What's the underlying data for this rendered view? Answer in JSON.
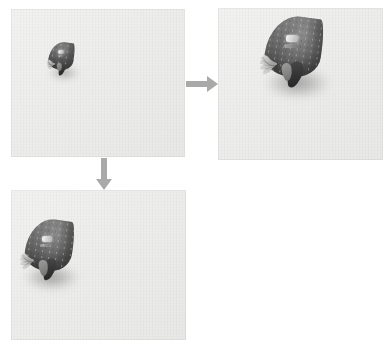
{
  "figure": {
    "kind": "image-sequence-diagram",
    "background_color": "#ffffff",
    "panel_background_color": "#ededec",
    "arrow_color": "#a9a9a9",
    "berry_body_color": "#6a6a6a",
    "berry_leaf_color": "#333333",
    "berry_sepal_color": "#b9b9b7"
  },
  "panels": [
    {
      "id": "panel-original",
      "name": "top-left-panel",
      "zoom_level": "1x",
      "x": 11,
      "y": 9,
      "width": 174,
      "height": 148,
      "subject_label": "strawberry",
      "subject": {
        "x": 36,
        "y": 32,
        "width": 31,
        "height": 35,
        "rotation": 0
      }
    },
    {
      "id": "panel-zoom-right",
      "name": "top-right-panel",
      "zoom_level": "3x",
      "x": 218,
      "y": 8,
      "width": 165,
      "height": 152,
      "subject_label": "strawberry",
      "subject": {
        "x": 43,
        "y": 6,
        "width": 68,
        "height": 76,
        "rotation": 0
      }
    },
    {
      "id": "panel-zoom-down",
      "name": "bottom-left-panel",
      "zoom_level": "2x",
      "x": 11,
      "y": 190,
      "width": 175,
      "height": 150,
      "subject_label": "strawberry",
      "subject": {
        "x": 10,
        "y": 28,
        "width": 57,
        "height": 65,
        "rotation": 0
      }
    }
  ],
  "arrows": [
    {
      "id": "arrow-right",
      "name": "arrow-right",
      "direction": "right",
      "from": "panel-original",
      "to": "panel-zoom-right",
      "x": 186,
      "y": 76,
      "length": 32,
      "thickness": 6
    },
    {
      "id": "arrow-down",
      "name": "arrow-down",
      "direction": "down",
      "from": "panel-original",
      "to": "panel-zoom-down",
      "x": 96,
      "y": 158,
      "length": 32,
      "thickness": 6
    }
  ]
}
